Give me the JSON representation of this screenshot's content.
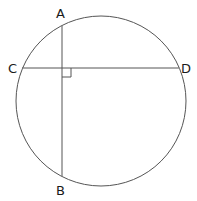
{
  "diagram": {
    "type": "circle-chords",
    "circle": {
      "cx": 101,
      "cy": 101,
      "r": 85
    },
    "points": {
      "A": {
        "label": "A",
        "x": 62,
        "y": 26
      },
      "B": {
        "label": "B",
        "x": 62,
        "y": 176
      },
      "C": {
        "label": "C",
        "x": 22,
        "y": 68
      },
      "D": {
        "label": "D",
        "x": 179,
        "y": 68
      }
    },
    "chords": [
      {
        "name": "AB",
        "from": "A",
        "to": "B"
      },
      {
        "name": "CD",
        "from": "C",
        "to": "D"
      }
    ],
    "right_angle_marker": {
      "at": "intersection",
      "x": 62,
      "y": 68,
      "size": 9
    },
    "colors": {
      "stroke": "#555555",
      "label": "#1a1a1a",
      "background": "#ffffff"
    }
  }
}
